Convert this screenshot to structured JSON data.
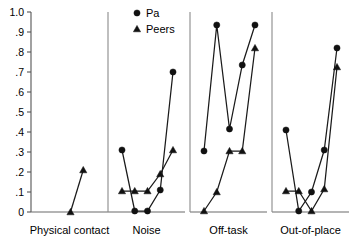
{
  "chart_data": {
    "type": "line",
    "title": "",
    "xlabel": "",
    "ylabel": "",
    "ylim": [
      0,
      1.0
    ],
    "grid": false,
    "legend_position": "top-center",
    "y_ticks": [
      "0",
      ".1",
      ".2",
      ".3",
      ".4",
      ".5",
      ".6",
      ".7",
      ".8",
      ".9",
      "1.0"
    ],
    "y_tick_values": [
      0,
      0.1,
      0.2,
      0.3,
      0.4,
      0.5,
      0.6,
      0.7,
      0.8,
      0.9,
      1.0
    ],
    "legend": [
      {
        "name": "Pa",
        "marker": "circle"
      },
      {
        "name": "Peers",
        "marker": "triangle"
      }
    ],
    "panels": [
      {
        "label": "Physical contact",
        "x": [
          1,
          2,
          3,
          4,
          5
        ],
        "series": [
          {
            "name": "Pa",
            "marker": "circle",
            "values": [
              null,
              null,
              null,
              null,
              null
            ]
          },
          {
            "name": "Peers",
            "marker": "triangle",
            "values": [
              null,
              null,
              0.0,
              0.21,
              null
            ]
          }
        ]
      },
      {
        "label": "Noise",
        "x": [
          1,
          2,
          3,
          4,
          5
        ],
        "series": [
          {
            "name": "Pa",
            "marker": "circle",
            "values": [
              0.31,
              0.005,
              0.005,
              0.11,
              0.7
            ]
          },
          {
            "name": "Peers",
            "marker": "triangle",
            "values": [
              0.105,
              0.105,
              0.105,
              0.19,
              0.31
            ]
          }
        ]
      },
      {
        "label": "Off-task",
        "x": [
          1,
          2,
          3,
          4,
          5
        ],
        "series": [
          {
            "name": "Pa",
            "marker": "circle",
            "values": [
              0.305,
              0.935,
              0.415,
              0.735,
              0.935
            ]
          },
          {
            "name": "Peers",
            "marker": "triangle",
            "values": [
              0.005,
              0.1,
              0.305,
              0.305,
              0.82
            ]
          }
        ]
      },
      {
        "label": "Out-of-place",
        "x": [
          1,
          2,
          3,
          4,
          5
        ],
        "series": [
          {
            "name": "Pa",
            "marker": "circle",
            "values": [
              0.41,
              0.005,
              0.1,
              0.31,
              0.82
            ]
          },
          {
            "name": "Peers",
            "marker": "triangle",
            "values": [
              0.105,
              0.105,
              0.005,
              0.115,
              0.725
            ]
          }
        ]
      }
    ],
    "colors": {
      "marker": "#111111",
      "line": "#1a1a1a",
      "axis": "#555555",
      "background": "#ffffff"
    }
  }
}
